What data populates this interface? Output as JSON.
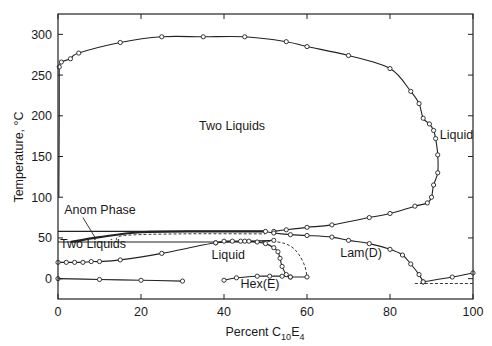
{
  "chart_data": {
    "type": "line",
    "title": "",
    "xlabel": "Percent C10E4",
    "xlabel_parts": {
      "base": "Percent C",
      "sub1": "10",
      "mid": "E",
      "sub2": "4"
    },
    "ylabel": "Temperature, °C",
    "xlim": [
      0,
      100
    ],
    "ylim": [
      -25,
      325
    ],
    "x_ticks": [
      0,
      20,
      40,
      60,
      80,
      100
    ],
    "y_ticks": [
      0,
      50,
      100,
      150,
      200,
      250,
      300
    ],
    "grid": false,
    "legend": null,
    "region_labels": [
      {
        "text": "Two Liquids",
        "x": 34,
        "y": 183
      },
      {
        "text": "Liquid",
        "x": 92,
        "y": 172
      },
      {
        "text": "Anom Phase",
        "x": 1.5,
        "y": 79
      },
      {
        "text": "Two Liquids",
        "x": 0.5,
        "y": 38
      },
      {
        "text": "Liquid",
        "x": 37,
        "y": 24
      },
      {
        "text": "Lam(D)",
        "x": 68,
        "y": 27
      },
      {
        "text": "Hex(E)",
        "x": 44,
        "y": -12
      }
    ],
    "series": [
      {
        "name": "upper consolute curve (Two Liquids / Liquid)",
        "style": "solid-with-markers",
        "points": [
          [
            0.3,
            260
          ],
          [
            0.8,
            266
          ],
          [
            3,
            270
          ],
          [
            5,
            277
          ],
          [
            15,
            290
          ],
          [
            25,
            297
          ],
          [
            35,
            297
          ],
          [
            45,
            297
          ],
          [
            55,
            291
          ],
          [
            60,
            285
          ],
          [
            70,
            274
          ],
          [
            80,
            258
          ],
          [
            85,
            230
          ],
          [
            87,
            215
          ],
          [
            88,
            197
          ],
          [
            89.5,
            190
          ],
          [
            90.5,
            182
          ],
          [
            91,
            172
          ],
          [
            91.5,
            152
          ],
          [
            91.5,
            130
          ],
          [
            90.5,
            115
          ],
          [
            90,
            100
          ],
          [
            89,
            93
          ],
          [
            86,
            89
          ],
          [
            80,
            80
          ],
          [
            75,
            75
          ],
          [
            66,
            66
          ],
          [
            60,
            63
          ],
          [
            55,
            60
          ],
          [
            52,
            58
          ]
        ]
      },
      {
        "name": "left vertical boundary near 0%",
        "style": "solid",
        "points": [
          [
            0.2,
            100
          ],
          [
            0.3,
            200
          ],
          [
            0.3,
            260
          ]
        ]
      },
      {
        "name": "lower two-liquid boundary (lower consolute)",
        "style": "solid-with-markers",
        "points": [
          [
            0,
            20
          ],
          [
            2,
            20
          ],
          [
            4,
            20
          ],
          [
            6,
            20
          ],
          [
            8,
            21
          ],
          [
            10,
            21
          ],
          [
            15,
            23
          ],
          [
            25,
            31
          ],
          [
            38,
            44
          ],
          [
            45,
            46
          ],
          [
            52,
            47
          ]
        ]
      },
      {
        "name": "anomalous phase upper line",
        "style": "solid",
        "points": [
          [
            0,
            58
          ],
          [
            100,
            58
          ]
        ],
        "x_extent": [
          0,
          50
        ]
      },
      {
        "name": "anomalous phase lower line",
        "style": "solid",
        "points": [
          [
            0,
            45
          ],
          [
            50,
            45
          ]
        ]
      },
      {
        "name": "anomalous phase lens",
        "style": "solid-thick",
        "points": [
          [
            3,
            45
          ],
          [
            10,
            51
          ],
          [
            20,
            57
          ],
          [
            35,
            58
          ],
          [
            50,
            58
          ]
        ]
      },
      {
        "name": "anomalous phase dashed",
        "style": "dashed",
        "points": [
          [
            14,
            47
          ],
          [
            16,
            53
          ],
          [
            30,
            55
          ],
          [
            50,
            55
          ]
        ]
      },
      {
        "name": "Lam(D) upper boundary",
        "style": "solid-with-markers",
        "points": [
          [
            50,
            58
          ],
          [
            52,
            56
          ],
          [
            56,
            54
          ],
          [
            60,
            53
          ],
          [
            66,
            51
          ],
          [
            70,
            47
          ],
          [
            75,
            43
          ],
          [
            80,
            36
          ],
          [
            83,
            29
          ],
          [
            85,
            18
          ],
          [
            87,
            5
          ],
          [
            88,
            -4
          ]
        ]
      },
      {
        "name": "Liquid / Hex(E) boundary",
        "style": "solid-with-markers",
        "points": [
          [
            38,
            44
          ],
          [
            40,
            46
          ],
          [
            42,
            46
          ],
          [
            44,
            46
          ],
          [
            46,
            46
          ],
          [
            48,
            45
          ],
          [
            50,
            43
          ],
          [
            52,
            38
          ],
          [
            53,
            33
          ],
          [
            53.5,
            25
          ],
          [
            54,
            15
          ],
          [
            55,
            5
          ],
          [
            56,
            2
          ]
        ]
      },
      {
        "name": "Lam(D) left dashed boundary",
        "style": "dashed",
        "points": [
          [
            48,
            46
          ],
          [
            53,
            45
          ],
          [
            56,
            40
          ],
          [
            58,
            30
          ],
          [
            59.5,
            15
          ],
          [
            60,
            2
          ]
        ]
      },
      {
        "name": "Hex(E) lower line",
        "style": "solid-with-markers",
        "points": [
          [
            40,
            -2
          ],
          [
            43,
            1
          ],
          [
            48,
            3
          ],
          [
            51,
            3
          ],
          [
            54,
            3
          ],
          [
            56,
            2
          ],
          [
            60,
            2
          ]
        ]
      },
      {
        "name": "Lam(D) to Liquid right",
        "style": "solid-with-markers",
        "points": [
          [
            88,
            -4
          ],
          [
            95,
            2
          ],
          [
            100,
            7
          ]
        ]
      },
      {
        "name": "eutectic dashed line",
        "style": "dashed",
        "points": [
          [
            86,
            -6
          ],
          [
            100,
            -6
          ]
        ]
      },
      {
        "name": "ice line near 0 °C",
        "style": "solid-with-markers",
        "points": [
          [
            0,
            0
          ],
          [
            10,
            -1
          ],
          [
            20,
            -2
          ],
          [
            30,
            -3
          ]
        ]
      }
    ]
  }
}
